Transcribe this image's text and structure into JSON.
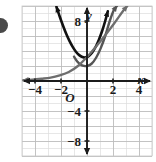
{
  "figure": {
    "background_color": "#ffffff",
    "bullet_marker": "bullet-dot",
    "bullet_color": "#3d3d3d"
  },
  "chart_data": {
    "type": "line",
    "title": "",
    "subtitle": "",
    "xlabel": "x",
    "ylabel": "y",
    "xlim": [
      -5,
      5
    ],
    "ylim": [
      -10,
      10
    ],
    "grid": true,
    "grid_step": 1,
    "grid_color": "#d9d9d9",
    "grid_major_color": "#bdbdbd",
    "axis_color": "#1b1b1b",
    "legend": "none",
    "origin_label": "O",
    "xticks": [
      -4,
      -2,
      2,
      4
    ],
    "xtick_labels": [
      "−4",
      "−2",
      "2",
      "4"
    ],
    "yticks": [
      8,
      -4,
      -8
    ],
    "ytick_labels": [
      "8",
      "−4",
      "−8"
    ],
    "series": [
      {
        "name": "curve-1-black",
        "color": "#111111",
        "width": 2.6,
        "arrow_start": "up-left",
        "arrow_end": "up-right",
        "x": [
          -2.35,
          -2.1,
          -1.85,
          -1.6,
          -1.35,
          -1.1,
          -0.85,
          -0.6,
          -0.35,
          -0.1,
          0.15,
          0.4,
          0.65,
          0.9,
          1.15,
          1.4,
          1.6
        ],
        "y": [
          9.9,
          8.6,
          7.4,
          6.3,
          5.35,
          4.55,
          3.9,
          3.45,
          3.2,
          3.15,
          3.35,
          3.8,
          4.5,
          5.45,
          6.6,
          8.0,
          9.3
        ]
      },
      {
        "name": "curve-2-dark-gray",
        "color": "#555555",
        "width": 2.4,
        "arrow_start": "none",
        "arrow_end": "up-right",
        "x": [
          -1.0,
          -0.75,
          -0.5,
          -0.25,
          0.0,
          0.35,
          0.7,
          1.05,
          1.4,
          1.75,
          2.05,
          2.3
        ],
        "y": [
          3.25,
          2.6,
          2.2,
          2.02,
          2.0,
          2.3,
          3.1,
          4.35,
          6.0,
          8.0,
          9.4,
          10.0
        ]
      },
      {
        "name": "curve-3-medium-gray",
        "color": "#6e6e6e",
        "width": 2.3,
        "arrow_start": "left",
        "arrow_end": "up-right",
        "x": [
          -4.9,
          -4.2,
          -3.5,
          -2.8,
          -2.1,
          -1.4,
          -0.7,
          0.0,
          0.7,
          1.4,
          2.1,
          2.8,
          3.1
        ],
        "y": [
          0.12,
          0.18,
          0.3,
          0.45,
          0.75,
          1.2,
          2.0,
          3.2,
          4.6,
          6.1,
          7.7,
          9.4,
          10.0
        ]
      }
    ],
    "annotations": []
  }
}
